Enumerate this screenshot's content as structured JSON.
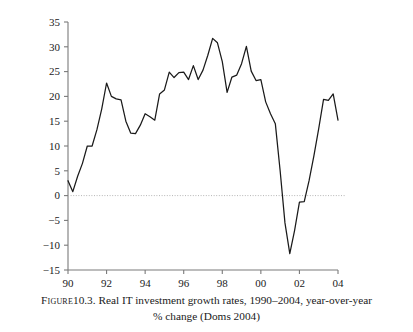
{
  "figure": {
    "caption_label": "Figure",
    "caption_number": "10.3.",
    "caption_line1": "Real IT investment growth rates, 1990–2004, year-over-year",
    "caption_line2": "% change (Doms 2004)",
    "caption_full": "Figure 10.3. Real IT investment growth rates, 1990–2004, year-over-year % change (Doms 2004)"
  },
  "colors": {
    "line": "#1a1a1a",
    "axis": "#7a7a7a",
    "zero_line": "#b5b5b5",
    "background": "#ffffff",
    "text": "#1a1a1a"
  },
  "chart_data": {
    "type": "line",
    "title": "",
    "subtitle": "",
    "xlabel": "",
    "ylabel": "",
    "xlim": [
      1990.0,
      2004.0
    ],
    "ylim": [
      -15,
      35
    ],
    "grid": false,
    "legend": "none",
    "zero_reference_line": 0,
    "x_tick_labels": [
      "90",
      "92",
      "94",
      "96",
      "98",
      "00",
      "02",
      "04"
    ],
    "x_tick_values": [
      1990,
      1992,
      1994,
      1996,
      1998,
      2000,
      2002,
      2004
    ],
    "y_tick_labels": [
      "35",
      "30",
      "25",
      "20",
      "15",
      "10",
      "5",
      "0",
      "−5",
      "−10",
      "−15"
    ],
    "y_tick_values": [
      35,
      30,
      25,
      20,
      15,
      10,
      5,
      0,
      -5,
      -10,
      -15
    ],
    "series": [
      {
        "name": "Real IT investment growth rate (% change, year-over-year)",
        "x": [
          1990.0,
          1990.25,
          1990.5,
          1990.75,
          1991.0,
          1991.25,
          1991.5,
          1991.75,
          1992.0,
          1992.25,
          1992.5,
          1992.75,
          1993.0,
          1993.25,
          1993.5,
          1993.75,
          1994.0,
          1994.25,
          1994.5,
          1994.75,
          1995.0,
          1995.25,
          1995.5,
          1995.75,
          1996.0,
          1996.25,
          1996.5,
          1996.75,
          1997.0,
          1997.25,
          1997.5,
          1997.75,
          1998.0,
          1998.25,
          1998.5,
          1998.75,
          1999.0,
          1999.25,
          1999.5,
          1999.75,
          2000.0,
          2000.25,
          2000.5,
          2000.75,
          2001.0,
          2001.25,
          2001.5,
          2001.75,
          2002.0,
          2002.25,
          2002.5,
          2002.75,
          2003.0,
          2003.25,
          2003.5,
          2003.75,
          2004.0
        ],
        "values": [
          3.0,
          0.8,
          3.9,
          6.5,
          10.0,
          10.0,
          13.3,
          17.5,
          22.7,
          20.0,
          19.5,
          19.3,
          15.0,
          12.6,
          12.5,
          14.2,
          16.5,
          15.9,
          15.2,
          20.5,
          21.3,
          24.9,
          23.8,
          24.8,
          24.9,
          23.4,
          26.2,
          23.4,
          25.3,
          28.3,
          31.7,
          30.8,
          27.0,
          20.8,
          23.9,
          24.3,
          26.6,
          30.1,
          25.1,
          23.2,
          23.4,
          18.9,
          16.5,
          14.5,
          5.0,
          -5.5,
          -11.7,
          -7.0,
          -1.3,
          -1.2,
          3.0,
          8.0,
          13.5,
          19.4,
          19.2,
          20.5,
          15.2
        ]
      }
    ],
    "annotations": {
      "peak_value": 31.7,
      "peak_year": "1997",
      "trough_value": -11.7,
      "trough_year": "2001",
      "start_value": 3.0,
      "end_value": 15.2
    }
  }
}
